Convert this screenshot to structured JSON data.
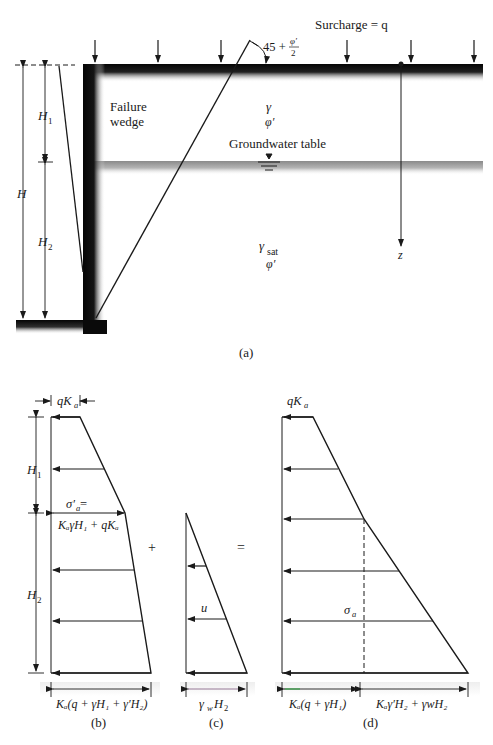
{
  "figure_a": {
    "surcharge_label": "Surcharge = q",
    "angle_label_prefix": "45 +",
    "angle_label_num": "φ′",
    "angle_label_den": "2",
    "failure_wedge_line1": "Failure",
    "failure_wedge_line2": "wedge",
    "upper_soil_gamma": "γ",
    "upper_soil_phi": "φ′",
    "groundwater_label": "Groundwater table",
    "lower_soil_gamma": "γ",
    "lower_soil_gamma_sub": "sat",
    "lower_soil_phi": "φ′",
    "depth_axis_label": "z",
    "dim_H": "H",
    "dim_H1": "H",
    "dim_H1_sub": "1",
    "dim_H2": "H",
    "dim_H2_sub": "2",
    "caption": "(a)"
  },
  "figure_b": {
    "top_label": "qK",
    "top_label_sub": "a",
    "dim_H1": "H",
    "dim_H1_sub": "1",
    "dim_H2": "H",
    "dim_H2_sub": "2",
    "sigma_label": "σ′",
    "sigma_label_sub": "a",
    "sigma_eq": " =",
    "sigma_value": "KₐγH₁ + qKₐ",
    "bottom_label": "Kₐ(q + γH₁ + γ′H₂)",
    "caption": "(b)"
  },
  "operators": {
    "plus": "+",
    "equals": "="
  },
  "figure_c": {
    "pressure_label": "u",
    "bottom_label": "γwH₂",
    "bottom_label_gamma": "γ",
    "bottom_label_w": "w",
    "bottom_label_H": "H",
    "bottom_label_2": "2",
    "caption": "(c)"
  },
  "figure_d": {
    "top_label": "qK",
    "top_label_sub": "a",
    "sigma_label": "σ",
    "sigma_label_sub": "a",
    "bottom_left_label": "Kₐ(q + γH₁)",
    "bottom_right_label": "Kₐγ′H₂ + γwH₂",
    "caption": "(d)"
  },
  "colors": {
    "line": "#1a1a1a",
    "wall": "#0a0a0a",
    "shadow": "#9a9a9a",
    "accent_green": "#3aa84a",
    "accent_magenta": "#b04aa0"
  }
}
